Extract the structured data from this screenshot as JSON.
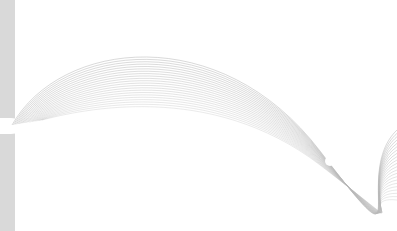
{
  "image": {
    "description": "Abstract decorative graphic with flowing grey wave lines and a grey vertical band on the left",
    "colors": {
      "background": "#ffffff",
      "band": "#d9d9d9",
      "lines": "#b8b8b8"
    },
    "line_count": 22
  }
}
